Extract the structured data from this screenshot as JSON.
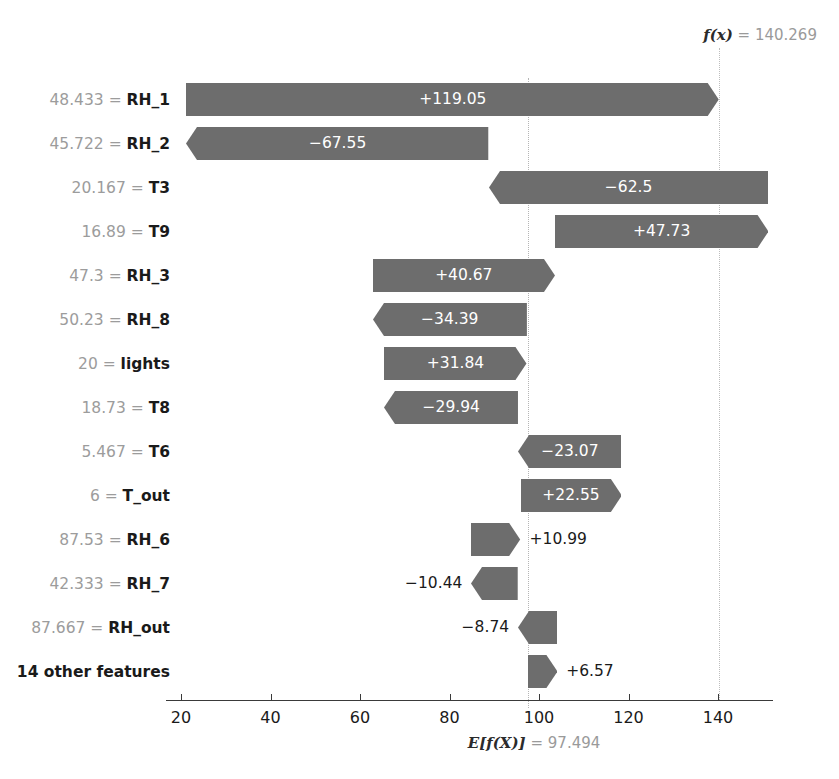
{
  "chart_data": {
    "type": "bar",
    "chart_style": "shap-waterfall",
    "title": "",
    "xlabel": "",
    "ylabel": "",
    "base_value_label": "E[f(X)]",
    "base_value": 97.494,
    "base_value_text": "97.494",
    "output_value_label": "f(x)",
    "output_value": 140.269,
    "output_value_text": "140.269",
    "xlim": [
      16.5,
      152
    ],
    "xticks": [
      20,
      40,
      60,
      80,
      100,
      120,
      140
    ],
    "xticklabels": [
      "20",
      "40",
      "60",
      "80",
      "100",
      "120",
      "140"
    ],
    "grid": false,
    "legend": "none",
    "bar_color": "#6d6d6d",
    "categories": [
      "48.433 = RH_1",
      "45.722 = RH_2",
      "20.167 = T3",
      "16.89 = T9",
      "47.3 = RH_3",
      "50.23 = RH_8",
      "20 = lights",
      "18.73 = T8",
      "5.467 = T6",
      "6 = T_out",
      "87.53 = RH_6",
      "42.333 = RH_7",
      "87.667 = RH_out",
      "14 other features"
    ],
    "values": [
      119.05,
      -67.55,
      -62.5,
      47.73,
      40.67,
      -34.39,
      31.84,
      -29.94,
      -23.07,
      22.55,
      10.99,
      -10.44,
      -8.74,
      6.57
    ],
    "rows": [
      {
        "feature_value": "48.433",
        "feature_name": "RH_1",
        "label": "48.433 = RH_1",
        "value": 119.05,
        "value_text": "+119.05",
        "sign": "positive",
        "start": 21.219,
        "end": 140.269,
        "label_inside": true
      },
      {
        "feature_value": "45.722",
        "feature_name": "RH_2",
        "label": "45.722 = RH_2",
        "value": -67.55,
        "value_text": "−67.55",
        "sign": "negative",
        "start": 88.769,
        "end": 21.219,
        "label_inside": true
      },
      {
        "feature_value": "20.167",
        "feature_name": "T3",
        "label": "20.167 = T3",
        "value": -62.5,
        "value_text": "−62.5",
        "sign": "negative",
        "start": 151.269,
        "end": 88.769,
        "label_inside": true
      },
      {
        "feature_value": "16.89",
        "feature_name": "T9",
        "label": "16.89 = T9",
        "value": 47.73,
        "value_text": "+47.73",
        "sign": "positive",
        "start": 103.539,
        "end": 151.269,
        "label_inside": true
      },
      {
        "feature_value": "47.3",
        "feature_name": "RH_3",
        "label": "47.3 = RH_3",
        "value": 40.67,
        "value_text": "+40.67",
        "sign": "positive",
        "start": 62.869,
        "end": 103.539,
        "label_inside": true
      },
      {
        "feature_value": "50.23",
        "feature_name": "RH_8",
        "label": "50.23 = RH_8",
        "value": -34.39,
        "value_text": "−34.39",
        "sign": "negative",
        "start": 97.259,
        "end": 62.869,
        "label_inside": true
      },
      {
        "feature_value": "20",
        "feature_name": "lights",
        "label": "20 = lights",
        "value": 31.84,
        "value_text": "+31.84",
        "sign": "positive",
        "start": 65.419,
        "end": 97.259,
        "label_inside": true
      },
      {
        "feature_value": "18.73",
        "feature_name": "T8",
        "label": "18.73 = T8",
        "value": -29.94,
        "value_text": "−29.94",
        "sign": "negative",
        "start": 95.359,
        "end": 65.419,
        "label_inside": true
      },
      {
        "feature_value": "5.467",
        "feature_name": "T6",
        "label": "5.467 = T6",
        "value": -23.07,
        "value_text": "−23.07",
        "sign": "negative",
        "start": 118.429,
        "end": 95.359,
        "label_inside": true
      },
      {
        "feature_value": "6",
        "feature_name": "T_out",
        "label": "6 = T_out",
        "value": 22.55,
        "value_text": "+22.55",
        "sign": "positive",
        "start": 95.879,
        "end": 118.429,
        "label_inside": true
      },
      {
        "feature_value": "87.53",
        "feature_name": "RH_6",
        "label": "87.53 = RH_6",
        "value": 10.99,
        "value_text": "+10.99",
        "sign": "positive",
        "start": 84.889,
        "end": 95.879,
        "label_inside": false
      },
      {
        "feature_value": "42.333",
        "feature_name": "RH_7",
        "label": "42.333 = RH_7",
        "value": -10.44,
        "value_text": "−10.44",
        "sign": "negative",
        "start": 95.329,
        "end": 84.889,
        "label_inside": false
      },
      {
        "feature_value": "87.667",
        "feature_name": "RH_out",
        "label": "87.667 = RH_out",
        "value": -8.74,
        "value_text": "−8.74",
        "sign": "negative",
        "start": 104.069,
        "end": 95.329,
        "label_inside": false
      },
      {
        "feature_value": "",
        "feature_name": "14 other features",
        "label": "14 other features",
        "value": 6.57,
        "value_text": "+6.57",
        "sign": "positive",
        "start": 97.494,
        "end": 104.069,
        "label_inside": false
      }
    ]
  }
}
